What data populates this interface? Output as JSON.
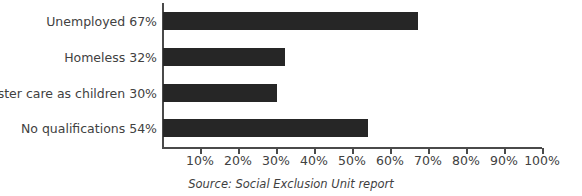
{
  "chart_data": {
    "type": "bar",
    "orientation": "horizontal",
    "title": "",
    "xlabel": "",
    "ylabel": "",
    "categories": [
      "Unemployed 67%",
      "Homeless 32%",
      "In foster care as children 30%",
      "No qualifications 54%"
    ],
    "values": [
      67,
      32,
      30,
      54
    ],
    "value_unit": "%",
    "xlim": [
      0,
      100
    ],
    "xticks": [
      10,
      20,
      30,
      40,
      50,
      60,
      70,
      80,
      90,
      100
    ],
    "xtick_labels": [
      "10%",
      "20%",
      "30%",
      "40%",
      "50%",
      "60%",
      "70%",
      "80%",
      "90%",
      "100%"
    ],
    "grid": false,
    "legend": null,
    "bar_color": "#262626",
    "axis_color": "#4a4a4a",
    "text_color": "#414141",
    "background": "#ffffff",
    "annotations": [
      {
        "name": "source-note",
        "text": "Source: Social Exclusion Unit report"
      }
    ]
  },
  "source": {
    "text": "Source: Social Exclusion Unit report"
  }
}
